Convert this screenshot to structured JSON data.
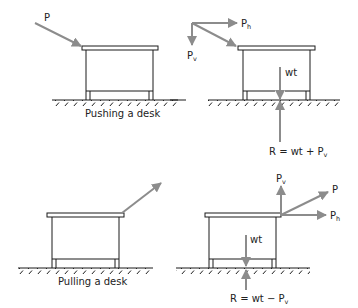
{
  "colors": {
    "line": "#1a1a1a",
    "arrow": "#8c8c8c",
    "background": "#ffffff"
  },
  "panels": [
    {
      "caption": "Pushing a desk",
      "forces": [
        {
          "label": "P",
          "subscript": ""
        }
      ]
    },
    {
      "caption": "",
      "forces": [
        {
          "label": "P",
          "subscript": "h"
        },
        {
          "label": "P",
          "subscript": "v"
        },
        {
          "label": "wt",
          "subscript": ""
        }
      ],
      "equation": {
        "lhs": "R = wt + P",
        "subscript": "v"
      }
    },
    {
      "caption": "Pulling a desk",
      "forces": []
    },
    {
      "caption": "",
      "forces": [
        {
          "label": "P",
          "subscript": "v"
        },
        {
          "label": "P",
          "subscript": ""
        },
        {
          "label": "P",
          "subscript": "h"
        },
        {
          "label": "wt",
          "subscript": ""
        }
      ],
      "equation": {
        "lhs": "R = wt − P",
        "subscript": "v"
      }
    }
  ]
}
